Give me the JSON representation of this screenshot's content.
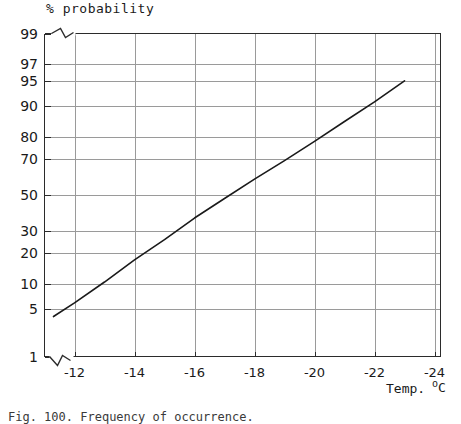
{
  "figure": {
    "caption": "Fig. 100. Frequency of occurrence.",
    "background": "#ffffff"
  },
  "chart_data": {
    "type": "line",
    "title": "% probability",
    "xlabel": "Temp.",
    "xunits_prefix": "",
    "xunits_degree": "o",
    "xunits_letter": "C",
    "ylabel": "% probability",
    "scale_x": "linear",
    "scale_y": "probit",
    "grid": true,
    "legend": "none",
    "xlim": [
      -11.0,
      -24.2
    ],
    "ylim": [
      1,
      99
    ],
    "x_ticks": [
      -12,
      -14,
      -16,
      -18,
      -20,
      -22,
      -24
    ],
    "x_tick_labels": [
      "-12",
      "-14",
      "-16",
      "-18",
      "-20",
      "-22",
      "-24"
    ],
    "y_ticks": [
      99,
      97,
      95,
      90,
      80,
      70,
      50,
      30,
      20,
      10,
      5,
      1
    ],
    "y_tick_labels": [
      "99",
      "97",
      "95",
      "90",
      "80",
      "70",
      "50",
      "30",
      "20",
      "10",
      "5",
      "1"
    ],
    "y_gridlines_drawn": [
      99,
      97,
      95,
      90,
      80,
      70,
      50,
      30,
      20,
      10,
      5,
      1
    ],
    "axis_break_top_left": true,
    "axis_break_bottom_left": true,
    "series": [
      {
        "name": "cumulative probability",
        "color": "#1a1a1a",
        "line_width": 1.6,
        "points": [
          {
            "x": -11.3,
            "y": 4.0
          },
          {
            "x": -12.0,
            "y": 6.0
          },
          {
            "x": -13.0,
            "y": 10.5
          },
          {
            "x": -14.0,
            "y": 17.5
          },
          {
            "x": -15.0,
            "y": 26.0
          },
          {
            "x": -16.0,
            "y": 37.0
          },
          {
            "x": -17.0,
            "y": 48.0
          },
          {
            "x": -18.0,
            "y": 59.0
          },
          {
            "x": -19.0,
            "y": 69.0
          },
          {
            "x": -20.0,
            "y": 78.0
          },
          {
            "x": -21.0,
            "y": 85.5
          },
          {
            "x": -22.0,
            "y": 91.0
          },
          {
            "x": -23.0,
            "y": 95.0
          }
        ]
      }
    ],
    "colors": {
      "line": "#1a1a1a",
      "grid": "#9a9a9a",
      "frame": "#2b2b2b",
      "text": "#1a1a1a"
    }
  }
}
